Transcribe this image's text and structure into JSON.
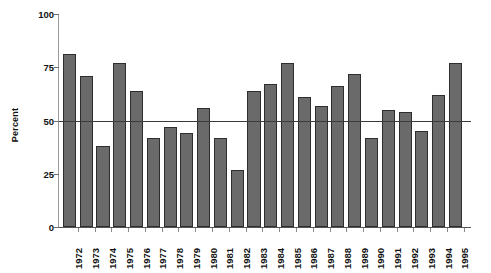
{
  "chart_data": {
    "type": "bar",
    "title": "",
    "subtitle": "",
    "xlabel": "",
    "ylabel": "Percent",
    "ylim": [
      0,
      100
    ],
    "yticks": [
      0,
      25,
      50,
      75,
      100
    ],
    "ytick_labels": [
      "0",
      "25",
      "50",
      "75",
      "100"
    ],
    "grid": false,
    "legend": null,
    "legend_position": "none",
    "reference_line": {
      "value": 50,
      "label": "",
      "color": "#3b3b3b"
    },
    "bar_color": "#6a6a6a",
    "bar_edge_color": "#2e2e2e",
    "categories": [
      "1972",
      "1973",
      "1974",
      "1975",
      "1976",
      "1977",
      "1978",
      "1979",
      "1980",
      "1981",
      "1982",
      "1983",
      "1984",
      "1985",
      "1986",
      "1987",
      "1988",
      "1989",
      "1990",
      "1991",
      "1992",
      "1993",
      "1994",
      "1995"
    ],
    "values": [
      81,
      71,
      38,
      77,
      64,
      42,
      47,
      44,
      56,
      42,
      27,
      64,
      67,
      77,
      61,
      57,
      66,
      72,
      42,
      55,
      54,
      45,
      62,
      77
    ]
  }
}
